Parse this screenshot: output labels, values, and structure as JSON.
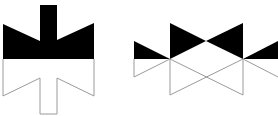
{
  "diagram": {
    "colors": {
      "fill": "#000000",
      "outline": "#9a9a9a",
      "background": "#ffffff"
    },
    "figures": [
      {
        "name": "cross-shape-figure",
        "filled_top": "M3,24 L40,41 L40,5 L57,5 L57,40 L94,23 L94,59 L3,59 Z",
        "outline_bottom": "M3,59 L3,96 L40,78 L40,114 L57,114 L57,78 L94,96 L94,59"
      },
      {
        "name": "bowtie-figure",
        "filled_top": [
          "M134,41 L170,59 L134,59 Z",
          "M170,23 L206,41 L170,59 Z",
          "M243,23 L206,41 L243,59 Z",
          "M243,59 L278,41 L278,59 Z"
        ],
        "outline_bottom": [
          "M134,59 L134,77 L170,59",
          "M170,59 L170,95",
          "M170,59 L243,95",
          "M170,95 L243,59",
          "M243,59 L243,95",
          "M243,59 L278,77",
          "M134,59 L278,59"
        ]
      }
    ]
  }
}
